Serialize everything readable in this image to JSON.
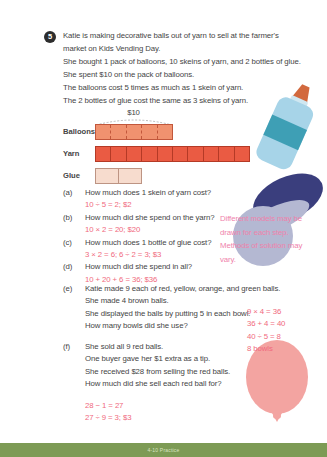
{
  "problem": {
    "number": "5",
    "intro_lines": [
      "Katie is making decorative balls out of yarn to sell at the farmer's",
      "market on Kids Vending Day.",
      "She bought 1 pack of balloons, 10 skeins of yarn, and 2 bottles of glue.",
      "She spent $10 on the pack of balloons.",
      "The balloons cost 5 times as much as 1 skein of yarn.",
      "The 2 bottles of glue cost the same as 3 skeins of yarn."
    ]
  },
  "bar_model": {
    "brace_label": "$10",
    "rows": [
      {
        "label": "Balloons",
        "units": 5,
        "divisions": 5,
        "fill": "#f0926f",
        "border": "#c2573b",
        "divider": "dashed"
      },
      {
        "label": "Yarn",
        "units": 10,
        "divisions": 10,
        "fill": "#ea5b43",
        "border": "#b53a26",
        "divider": "solid"
      },
      {
        "label": "Glue",
        "units": 3,
        "divisions": 2,
        "fill": "#f7dcce",
        "border": "#bd9483",
        "divider": "solid"
      }
    ]
  },
  "questions": [
    {
      "id": "(a)",
      "text": "How much does 1 skein of yarn cost?",
      "answer": "10 ÷ 5 = 2; $2"
    },
    {
      "id": "(b)",
      "text": "How much did she spend on the yarn?",
      "answer": "10 × 2 = 20; $20"
    },
    {
      "id": "(c)",
      "text": "How much does 1 bottle of glue cost?",
      "answer": "3 × 2 = 6; 6 ÷ 2 = 3; $3"
    },
    {
      "id": "(d)",
      "text": "How much did she spend in all?",
      "answer": "10 + 20 + 6 = 36; $36"
    }
  ],
  "side_note": {
    "lines": [
      "Different models may be",
      "drawn for each step.",
      "Methods of solution may",
      "vary."
    ]
  },
  "part_e": {
    "id": "(e)",
    "lines": [
      "Katie made 9 each of red, yellow, orange, and green balls.",
      "She made 4 brown balls.",
      "She displayed the balls by putting 5 in each bowl.",
      "How many bowls did she use?"
    ],
    "answers": [
      "9 × 4 = 36",
      "36 + 4 = 40",
      "40 ÷ 5 = 8",
      "8 bowls"
    ]
  },
  "part_f": {
    "id": "(f)",
    "lines": [
      "She sold all 9 red balls.",
      "One buyer gave her $1 extra as a tip.",
      "She received $28 from selling the red balls.",
      "How much did she sell each red ball for?"
    ],
    "answers": [
      "28 − 1 = 27",
      "27 ÷ 9 = 3; $3"
    ]
  },
  "footer": {
    "label": "4-10 Practice"
  },
  "colors": {
    "body_text": "#454545",
    "answer_text": "#f06a7e",
    "side_note_text": "#ef82ab",
    "footer_bar": "#7d9b55",
    "glue_bottle_body": "#a7d4e8",
    "glue_bottle_band": "#3e9fb5",
    "glue_bottle_tip": "#d2693e",
    "yarn_ball_dark": "#3a3e7d",
    "yarn_ball_light": "#b4b8d2",
    "balloon_pink": "#f3a4a1"
  }
}
